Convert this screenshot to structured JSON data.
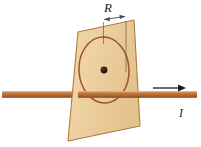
{
  "figure": {
    "background_color": "#ffffff",
    "labels": {
      "radius": "R",
      "current": "I"
    },
    "colors": {
      "plane_fill": "#efd3a4",
      "plane_edge": "#b07a3c",
      "loop_stroke": "#a0522d",
      "wire": "#c1743c",
      "wire_edge": "#8a4b1e",
      "center_dot": "#2b1a0f",
      "arrow_black": "#1a1a1a",
      "dimension_line": "#4a4a5a"
    },
    "elements": {
      "plane_name": "inclined rectangular plane",
      "loop_name": "circular current loop",
      "wire_name": "straight current-carrying wire",
      "dot_name": "loop center point",
      "current_arrow_name": "current direction arrow",
      "radius_dimension_name": "radius dimension arrow"
    },
    "geometry": {
      "plane_corners": "78,32 134,20 140,126 68,141",
      "loop_center_x": 104,
      "loop_center_y": 70,
      "loop_rx": 25,
      "loop_ry": 33,
      "wire_y": 95,
      "wire_x_start": 2,
      "wire_x_end": 197,
      "radius_dim_y": 19,
      "radius_dim_x1": 103,
      "radius_dim_x2": 126,
      "current_arrow_x1": 153,
      "current_arrow_x2": 186,
      "current_arrow_y": 88
    }
  }
}
